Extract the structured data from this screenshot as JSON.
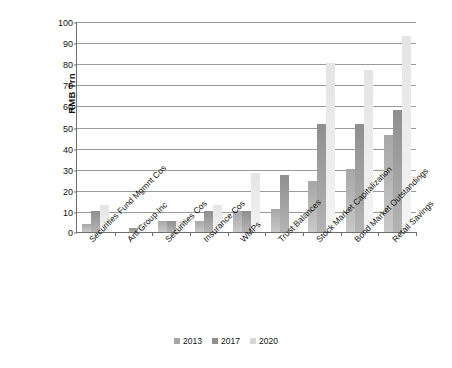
{
  "chart_data": {
    "type": "bar",
    "title": "",
    "xlabel": "",
    "ylabel": "RMB Trn",
    "ylim": [
      0,
      100
    ],
    "ytick_step": 10,
    "yticks": [
      0,
      10,
      20,
      30,
      40,
      50,
      60,
      70,
      80,
      90,
      100
    ],
    "grid": true,
    "legend_position": "bottom",
    "categories": [
      "Securities Fund Mgmnt Cos",
      "Ant Group Inc",
      "Securities Cos",
      "Insurance Cos",
      "WMPs",
      "Trust Balances",
      "Stock Market Capitalization",
      "Bond Market Outstandings",
      "Retail Savings"
    ],
    "series": [
      {
        "name": "2013",
        "color": "#a7a7a7",
        "values": [
          4,
          0,
          5,
          5,
          10,
          11,
          24,
          30,
          46
        ]
      },
      {
        "name": "2017",
        "color": "#8f8f8f",
        "values": [
          10,
          2,
          5,
          10,
          10,
          27,
          51,
          51,
          58
        ]
      },
      {
        "name": "2020",
        "color": "#d8d8d8",
        "values": [
          13,
          3,
          5,
          13,
          28,
          3,
          80,
          77,
          93
        ]
      }
    ]
  }
}
